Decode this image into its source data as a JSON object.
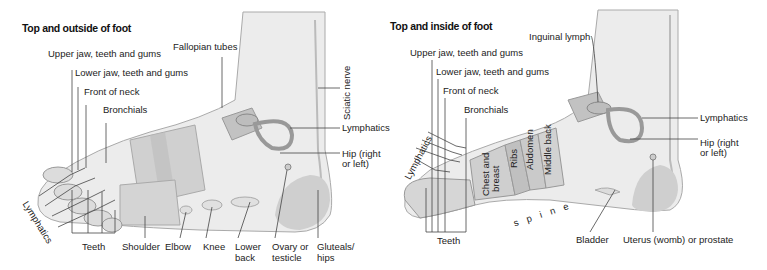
{
  "left_panel": {
    "title": "Top and outside of foot",
    "labels": {
      "upper_jaw": "Upper jaw, teeth and gums",
      "lower_jaw": "Lower jaw, teeth and gums",
      "front_neck": "Front of neck",
      "bronchials": "Bronchials",
      "fallopian": "Fallopian tubes",
      "sciatic": "Sciatic nerve",
      "lymphatics_right": "Lymphatics",
      "hip_line1": "Hip (right",
      "hip_line2": "or left)",
      "lymphatics_toes": "Lymphatics",
      "teeth": "Teeth",
      "shoulder": "Shoulder",
      "elbow": "Elbow",
      "knee": "Knee",
      "lower_back_1": "Lower",
      "lower_back_2": "back",
      "ovary_1": "Ovary or",
      "ovary_2": "testicle",
      "gluteals_1": "Gluteals/",
      "gluteals_2": "hips"
    }
  },
  "right_panel": {
    "title": "Top and inside of foot",
    "labels": {
      "inguinal": "Inguinal lymph",
      "upper_jaw": "Upper jaw, teeth and gums",
      "lower_jaw": "Lower jaw, teeth and gums",
      "front_neck": "Front of neck",
      "bronchials": "Bronchials",
      "lymphatics_right": "Lymphatics",
      "hip_line1": "Hip (right",
      "hip_line2": "or left)",
      "lymphatics_toes": "Lymphatics",
      "chest_1": "Chest and",
      "chest_2": "breast",
      "ribs": "Ribs",
      "abdomen": "Abdomen",
      "middle_back": "Middle back",
      "spine": "s p i n e",
      "teeth": "Teeth",
      "bladder": "Bladder",
      "uterus": "Uterus (womb) or prostate"
    }
  },
  "colors": {
    "skin_light": "#ececec",
    "skin_mid": "#d8d8d8",
    "zone_dark": "#bdbdbd",
    "outline": "#9a9a9a",
    "leader": "#444444"
  }
}
